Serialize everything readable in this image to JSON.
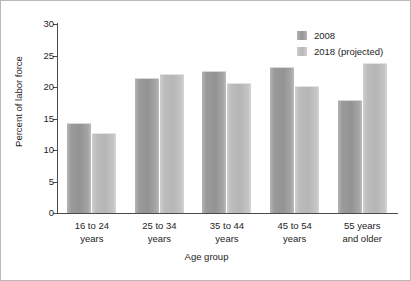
{
  "chart_data": {
    "type": "bar",
    "title": "",
    "subtitle": "",
    "xlabel": "Age group",
    "ylabel": "Percent of labor force",
    "categories": [
      "16 to 24 years",
      "25 to 34 years",
      "35 to 44 years",
      "45 to 54 years",
      "55 years and older"
    ],
    "category_lines": [
      [
        "16 to 24",
        "years"
      ],
      [
        "25 to 34",
        "years"
      ],
      [
        "35 to 44",
        "years"
      ],
      [
        "45 to 54",
        "years"
      ],
      [
        "55 years",
        "and older"
      ]
    ],
    "series": [
      {
        "name": "2008",
        "color": "#9a9a9a",
        "values": [
          14.3,
          21.5,
          22.6,
          23.2,
          18.0
        ]
      },
      {
        "name": "2018 (projected)",
        "color": "#b8b8b8",
        "values": [
          12.7,
          22.0,
          20.7,
          20.2,
          23.8
        ]
      }
    ],
    "ylim": [
      0,
      30
    ],
    "yticks": [
      0,
      5,
      10,
      15,
      20,
      25,
      30
    ],
    "ytick_labels": [
      "0",
      "5",
      "10",
      "15",
      "20",
      "25",
      "30"
    ],
    "grid": false,
    "legend_position": "top-right",
    "legend_entries": [
      "2008",
      "2018 (projected)"
    ]
  },
  "figure": {
    "background_color": "#ffffff",
    "border_color": "#b9b9b9",
    "axis_color": "#4a4a4a",
    "text_color": "#1d1d1d"
  }
}
